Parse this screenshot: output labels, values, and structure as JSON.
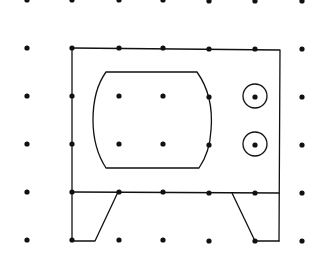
{
  "diagram": {
    "type": "dot-grid drawing",
    "colors": {
      "background": "#ffffff",
      "stroke": "#111111",
      "dot": "#111111"
    },
    "grid": {
      "columns_x": [
        27,
        72,
        119,
        163,
        209,
        255,
        302
      ],
      "rows_y": [
        0,
        48,
        96,
        144,
        192,
        240
      ],
      "dot_radius": 2.6
    },
    "tv_body": {
      "top_left": [
        72,
        48
      ],
      "top_right": [
        280,
        50
      ],
      "bottom_right": [
        279,
        241
      ],
      "divider_y": 192
    },
    "screen": {
      "top_y": 72,
      "bottom_y": 168,
      "top_left_x": 106,
      "top_right_x": 197,
      "bottom_left_x": 106,
      "bottom_right_x": 199
    },
    "knobs": [
      {
        "cx": 255,
        "cy": 96,
        "r": 12
      },
      {
        "cx": 255,
        "cy": 144,
        "r": 12
      }
    ],
    "legs": {
      "left": {
        "points": [
          [
            72,
            192
          ],
          [
            72,
            241
          ],
          [
            95,
            241
          ],
          [
            118,
            192
          ]
        ]
      },
      "right": {
        "points": [
          [
            232,
            193
          ],
          [
            255,
            241
          ],
          [
            279,
            241
          ]
        ]
      }
    }
  }
}
